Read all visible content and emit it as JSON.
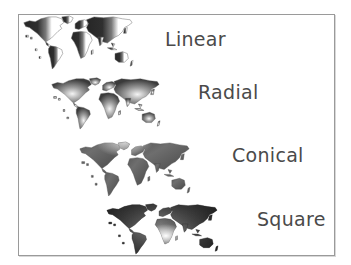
{
  "figure": {
    "items": [
      {
        "label": "Linear",
        "fill": "linear"
      },
      {
        "label": "Radial",
        "fill": "radial"
      },
      {
        "label": "Conical",
        "fill": "conical"
      },
      {
        "label": "Square",
        "fill": "square"
      }
    ]
  },
  "colors": {
    "frame_border": "#9a9a9a",
    "label_text": "#4a4a4a",
    "dark": "#2e2e2e",
    "light": "#ffffff"
  }
}
